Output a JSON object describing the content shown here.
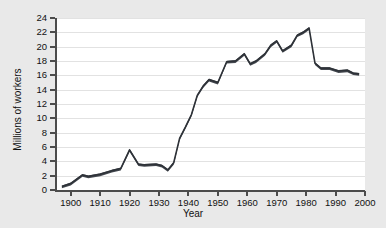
{
  "figure": {
    "background_color": "#e9e9e9",
    "plot_background_color": "#ffffff",
    "axis_color": "#4c4c4c",
    "gridline_color": "#e2e2e2",
    "series_color": "#44484f"
  },
  "chart_data": {
    "type": "line",
    "title": "",
    "xlabel": "Year",
    "ylabel": "Millions of workers",
    "xlim": [
      1895,
      2000
    ],
    "ylim": [
      0,
      24
    ],
    "xticks": [
      1900,
      1910,
      1920,
      1930,
      1940,
      1950,
      1960,
      1970,
      1980,
      1990,
      2000
    ],
    "xtick_labels": [
      "1900",
      "1910",
      "1920",
      "1930",
      "1940",
      "1950",
      "1960",
      "1970",
      "1980",
      "1990",
      "2000"
    ],
    "yticks": [
      0,
      2,
      4,
      6,
      8,
      10,
      12,
      14,
      16,
      18,
      20,
      22,
      24
    ],
    "ytick_labels": [
      "0",
      "2",
      "4",
      "6",
      "8",
      "10",
      "12",
      "14",
      "16",
      "18",
      "20",
      "22",
      "24"
    ],
    "grid": "horizontal",
    "legend": "none",
    "series": [
      {
        "name": "Union membership",
        "x": [
          1897,
          1900,
          1904,
          1906,
          1910,
          1914,
          1917,
          1920,
          1923,
          1925,
          1929,
          1931,
          1933,
          1935,
          1937,
          1939,
          1941,
          1943,
          1945,
          1947,
          1950,
          1953,
          1956,
          1959,
          1961,
          1963,
          1966,
          1968,
          1970,
          1972,
          1975,
          1977,
          1979,
          1981,
          1983,
          1985,
          1988,
          1991,
          1994,
          1996,
          1998
        ],
        "values": [
          0.5,
          0.9,
          2.1,
          1.9,
          2.2,
          2.7,
          3.0,
          5.6,
          3.6,
          3.5,
          3.6,
          3.4,
          2.8,
          3.8,
          7.2,
          8.8,
          10.5,
          13.2,
          14.5,
          15.4,
          15.0,
          17.9,
          18.0,
          19.0,
          17.6,
          18.0,
          19.0,
          20.2,
          20.8,
          19.4,
          20.2,
          21.6,
          22.0,
          22.6,
          17.7,
          17.0,
          17.0,
          16.6,
          16.7,
          16.3,
          16.2
        ]
      }
    ]
  }
}
